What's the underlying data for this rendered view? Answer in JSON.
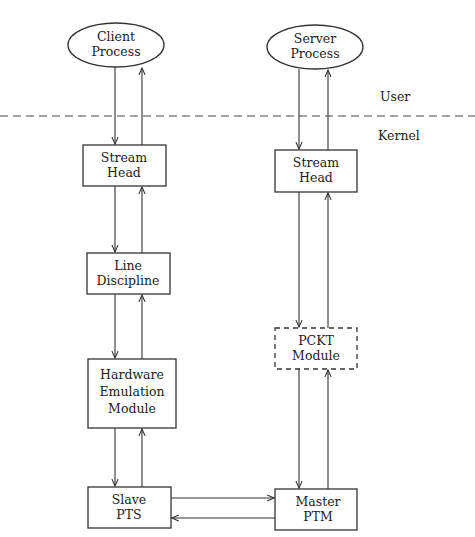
{
  "diagram": {
    "regions": {
      "user": "User",
      "kernel": "Kernel"
    },
    "nodes": {
      "client": {
        "line1": "Client",
        "line2": "Process"
      },
      "server": {
        "line1": "Server",
        "line2": "Process"
      },
      "client_stream_head": {
        "line1": "Stream",
        "line2": "Head"
      },
      "line_discipline": {
        "line1": "Line",
        "line2": "Discipline"
      },
      "hw_emulation": {
        "line1": "Hardware",
        "line2": "Emulation",
        "line3": "Module"
      },
      "slave_pts": {
        "line1": "Slave",
        "line2": "PTS"
      },
      "server_stream_head": {
        "line1": "Stream",
        "line2": "Head"
      },
      "pckt_module": {
        "line1": "PCKT",
        "line2": "Module"
      },
      "master_ptm": {
        "line1": "Master",
        "line2": "PTM"
      }
    }
  }
}
